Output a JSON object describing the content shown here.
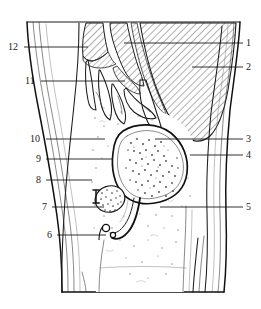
{
  "figure": {
    "style": "black and white line art with hatching and stippling",
    "width": 261,
    "height": 309,
    "ink_color": "#111111",
    "background_color": "#ffffff"
  },
  "labels": {
    "left": [
      {
        "id": "label-12",
        "text": "12",
        "text_x": 8,
        "text_y": 50,
        "line_x1": 24,
        "line_y1": 47,
        "line_x2": 88,
        "line_y2": 47
      },
      {
        "id": "label-11",
        "text": "11",
        "text_x": 25,
        "text_y": 84,
        "line_x1": 41,
        "line_y1": 81,
        "line_x2": 125,
        "line_y2": 81
      },
      {
        "id": "label-10",
        "text": "10",
        "text_x": 30,
        "text_y": 142,
        "line_x1": 46,
        "line_y1": 139,
        "line_x2": 105,
        "line_y2": 139
      },
      {
        "id": "label-9",
        "text": "9",
        "text_x": 36,
        "text_y": 162,
        "line_x1": 46,
        "line_y1": 159,
        "line_x2": 113,
        "line_y2": 159
      },
      {
        "id": "label-8",
        "text": "8",
        "text_x": 36,
        "text_y": 183,
        "line_x1": 46,
        "line_y1": 180,
        "line_x2": 92,
        "line_y2": 180
      },
      {
        "id": "label-7",
        "text": "7",
        "text_x": 42,
        "text_y": 210,
        "line_x1": 52,
        "line_y1": 207,
        "line_x2": 104,
        "line_y2": 207
      },
      {
        "id": "label-6",
        "text": "6",
        "text_x": 47,
        "text_y": 238,
        "line_x1": 57,
        "line_y1": 235,
        "line_x2": 106,
        "line_y2": 235
      }
    ],
    "right": [
      {
        "id": "label-1",
        "text": "1",
        "text_x": 246,
        "text_y": 46,
        "line_x1": 243,
        "line_y1": 43,
        "line_x2": 124,
        "line_y2": 43
      },
      {
        "id": "label-2",
        "text": "2",
        "text_x": 246,
        "text_y": 70,
        "line_x1": 243,
        "line_y1": 67,
        "line_x2": 192,
        "line_y2": 67
      },
      {
        "id": "label-3",
        "text": "3",
        "text_x": 246,
        "text_y": 142,
        "line_x1": 243,
        "line_y1": 139,
        "line_x2": 155,
        "line_y2": 139
      },
      {
        "id": "label-4",
        "text": "4",
        "text_x": 246,
        "text_y": 158,
        "line_x1": 243,
        "line_y1": 155,
        "line_x2": 190,
        "line_y2": 155
      },
      {
        "id": "label-5",
        "text": "5",
        "text_x": 246,
        "text_y": 210,
        "line_x1": 243,
        "line_y1": 207,
        "line_x2": 160,
        "line_y2": 207
      }
    ]
  }
}
